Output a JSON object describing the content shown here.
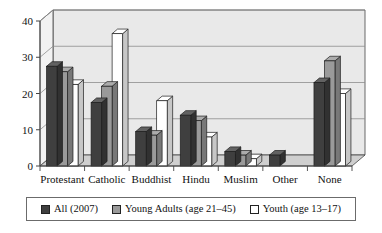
{
  "chart_data": {
    "type": "bar",
    "title": "",
    "xlabel": "",
    "ylabel": "",
    "ylim": [
      0,
      40
    ],
    "yticks": [
      0,
      10,
      20,
      30,
      40
    ],
    "ytick_labels": [
      "0",
      "10",
      "20",
      "30",
      "40"
    ],
    "grid": true,
    "legend_position": "bottom",
    "style": "3d-bar",
    "categories": [
      "Protestant",
      "Catholic",
      "Buddhist",
      "Hindu",
      "Muslim",
      "Other",
      "None"
    ],
    "series": [
      {
        "name": "All (2007)",
        "color": "#3f3f3f",
        "values": [
          27.5,
          17.5,
          9.5,
          14,
          4,
          3,
          23
        ]
      },
      {
        "name": "Young Adults (age 21–45)",
        "color": "#9a9a9a",
        "values": [
          26,
          22,
          8.5,
          12.5,
          3,
          0,
          29
        ]
      },
      {
        "name": "Youth (age 13–17)",
        "color": "#ffffff",
        "values": [
          22.5,
          36.5,
          18,
          8,
          2,
          0,
          20
        ]
      }
    ]
  },
  "legend": {
    "items": [
      {
        "label": "All (2007)",
        "swatch": "#3f3f3f"
      },
      {
        "label": "Young Adults (age 21–45)",
        "swatch": "#9a9a9a"
      },
      {
        "label": "Youth (age 13–17)",
        "swatch": "#ffffff"
      }
    ]
  },
  "colors": {
    "series_all": "#3f3f3f",
    "series_young_adults": "#9a9a9a",
    "series_youth": "#ffffff",
    "plot_background": "#e9e9e9",
    "floor": "#cfcfcf",
    "gridline": "#8d8d8d",
    "axis": "#444444"
  }
}
